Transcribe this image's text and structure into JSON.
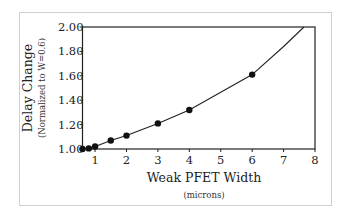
{
  "chart_data": {
    "type": "line",
    "title": "",
    "xlabel": "Weak PFET Width",
    "xlabel_sub": "(microns)",
    "ylabel": "Delay Change",
    "ylabel_sub": "(Normalized to W=0.6)",
    "xlim": [
      0.6,
      8
    ],
    "ylim": [
      1.0,
      2.0
    ],
    "x_ticks": [
      1,
      2,
      3,
      4,
      5,
      6,
      7,
      8
    ],
    "y_ticks": [
      "1.00",
      "1.20",
      "1.40",
      "1.60",
      "1.80",
      "2.00"
    ],
    "grid": false,
    "legend": null,
    "series": [
      {
        "name": "Delay Change",
        "markers": true,
        "points": [
          {
            "x": 0.6,
            "y": 1.0
          },
          {
            "x": 0.8,
            "y": 1.005
          },
          {
            "x": 1.0,
            "y": 1.02
          },
          {
            "x": 1.5,
            "y": 1.07
          },
          {
            "x": 2.0,
            "y": 1.11
          },
          {
            "x": 3.0,
            "y": 1.21
          },
          {
            "x": 4.0,
            "y": 1.32
          },
          {
            "x": 6.0,
            "y": 1.61
          }
        ],
        "line_extension": [
          {
            "x": 7.0,
            "y": 1.84
          },
          {
            "x": 7.65,
            "y": 2.0
          }
        ]
      }
    ]
  }
}
